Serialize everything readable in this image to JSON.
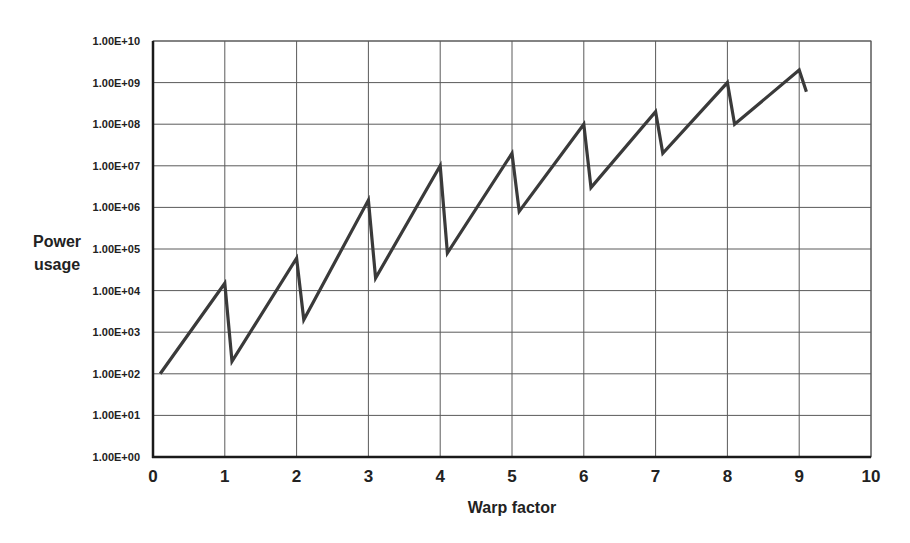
{
  "chart_data": {
    "type": "line",
    "title": "",
    "xlabel": "Warp factor",
    "ylabel": "Power usage",
    "ylabel_lines": [
      "Power",
      "usage"
    ],
    "yscale": "log",
    "xlim": [
      0,
      10
    ],
    "ylim": [
      1,
      10000000000
    ],
    "grid": true,
    "legend": null,
    "x_ticks": [
      "0",
      "1",
      "2",
      "3",
      "4",
      "5",
      "6",
      "7",
      "8",
      "9",
      "10"
    ],
    "y_ticks": [
      "1.00E+00",
      "1.00E+01",
      "1.00E+02",
      "1.00E+03",
      "1.00E+04",
      "1.00E+05",
      "1.00E+06",
      "1.00E+07",
      "1.00E+08",
      "1.00E+09",
      "1.00E+10"
    ],
    "series": [
      {
        "name": "Power usage",
        "color": "#3a3a3a",
        "x": [
          0.1,
          1.0,
          1.1,
          2.0,
          2.1,
          3.0,
          3.1,
          4.0,
          4.1,
          5.0,
          5.1,
          6.0,
          6.1,
          7.0,
          7.1,
          8.0,
          8.1,
          9.0,
          9.1
        ],
        "y": [
          100,
          15000,
          200,
          60000,
          2000,
          1500000,
          20000,
          10000000,
          80000,
          20000000,
          800000,
          100000000,
          3000000,
          200000000,
          20000000,
          1000000000,
          100000000,
          2000000000,
          600000000
        ]
      }
    ]
  },
  "colors": {
    "line": "#3a3a3a",
    "grid": "#5a5a5a",
    "axis": "#1a1a1a",
    "background": "#ffffff"
  }
}
